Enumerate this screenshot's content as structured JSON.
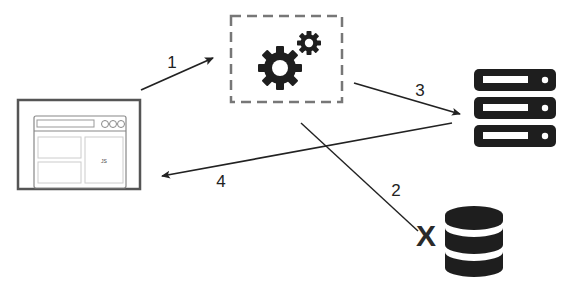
{
  "diagram": {
    "nodes": {
      "browser": {
        "label": "JS",
        "icon": "browser-window-icon"
      },
      "processor": {
        "icon": "gears-icon"
      },
      "server": {
        "icon": "server-stack-icon"
      },
      "database": {
        "icon": "database-icon",
        "status": "X"
      }
    },
    "edges": [
      {
        "id": "1",
        "label": "1",
        "from": "browser",
        "to": "processor"
      },
      {
        "id": "2",
        "label": "2",
        "from": "processor",
        "to": "database"
      },
      {
        "id": "3",
        "label": "3",
        "from": "processor",
        "to": "server"
      },
      {
        "id": "4",
        "label": "4",
        "from": "server",
        "to": "browser"
      }
    ],
    "colors": {
      "stroke": "#222222",
      "light": "#cccccc",
      "icon": "#1e1e1e",
      "frame": "#555555"
    }
  }
}
